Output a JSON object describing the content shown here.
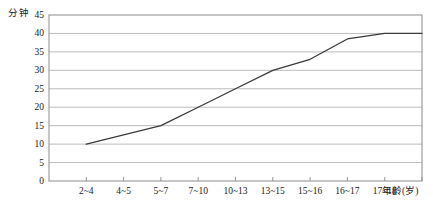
{
  "chart_data": {
    "type": "line",
    "title": "",
    "xlabel": "年龄(岁)",
    "ylabel": "分钟",
    "categories": [
      "2~4",
      "4~5",
      "5~7",
      "7~10",
      "10~13",
      "13~15",
      "15~16",
      "16~17",
      "17~18"
    ],
    "values": [
      10,
      12.5,
      15,
      20,
      25,
      30,
      33,
      38.5,
      40
    ],
    "ylim": [
      0,
      45
    ],
    "yticks": [
      0,
      5,
      10,
      15,
      20,
      25,
      30,
      35,
      40,
      45
    ],
    "ytick_labels": [
      "0",
      "5",
      "10",
      "15",
      "20",
      "25",
      "30",
      "35",
      "40",
      "45"
    ],
    "grid": true,
    "legend": "none",
    "line_color": "#3a3a3a",
    "grid_color": "#b4b4b4",
    "frame_color": "#8c8c8c",
    "plateau_value": 40,
    "start_value": 10
  }
}
